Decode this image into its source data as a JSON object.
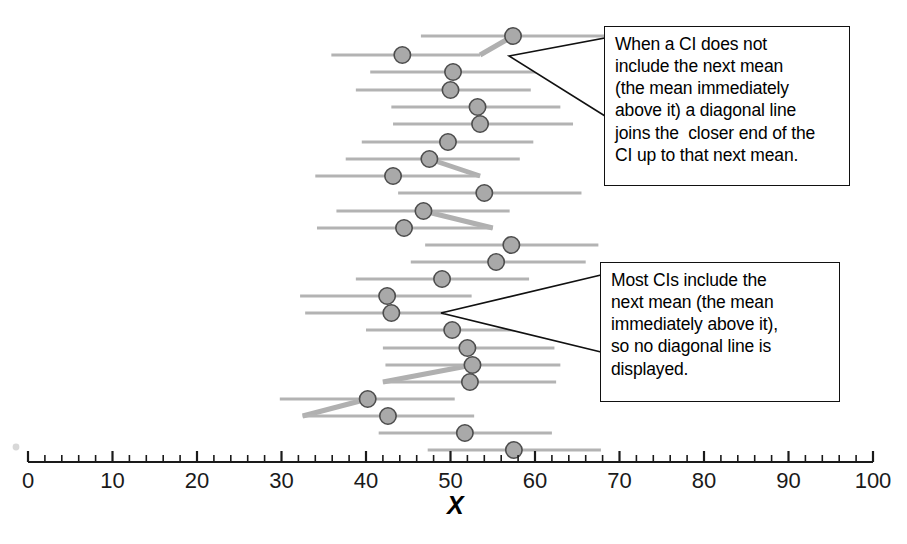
{
  "figure": {
    "axis_label": "X",
    "stray_mark": "speck"
  },
  "chart_data": {
    "type": "scatter",
    "title": "",
    "subtitle": "",
    "xlabel": "X",
    "ylabel": "",
    "xlim": [
      0,
      100
    ],
    "x_ticks": [
      0,
      10,
      20,
      30,
      40,
      50,
      60,
      70,
      80,
      90,
      100
    ],
    "x_tick_labels": [
      "0",
      "10",
      "20",
      "30",
      "40",
      "50",
      "60",
      "70",
      "80",
      "90",
      "100"
    ],
    "minor_tick_step": 2,
    "grid": false,
    "legend": "none",
    "orientation": "horizontal",
    "n_intervals": 22,
    "series": [
      {
        "name": "Confidence intervals",
        "marker": "filled-circle",
        "marker_color": "#a9a9a9",
        "marker_edge_color": "#4d4d4d",
        "line_color": "#b3b3b3",
        "points": [
          {
            "row": 1,
            "y_px": 36,
            "mean": 57.4,
            "ci_low": 46.5,
            "ci_high": 69.0,
            "diagonal_to_next": false
          },
          {
            "row": 2,
            "y_px": 55,
            "mean": 44.3,
            "ci_low": 35.9,
            "ci_high": 53.5,
            "diagonal_to_next": true,
            "diagonal_side": "right"
          },
          {
            "row": 3,
            "y_px": 72,
            "mean": 50.3,
            "ci_low": 40.5,
            "ci_high": 60.5,
            "diagonal_to_next": false
          },
          {
            "row": 4,
            "y_px": 90,
            "mean": 50.0,
            "ci_low": 38.8,
            "ci_high": 59.5,
            "diagonal_to_next": false
          },
          {
            "row": 5,
            "y_px": 107,
            "mean": 53.2,
            "ci_low": 43.0,
            "ci_high": 63.0,
            "diagonal_to_next": false
          },
          {
            "row": 6,
            "y_px": 124,
            "mean": 53.5,
            "ci_low": 43.2,
            "ci_high": 64.5,
            "diagonal_to_next": false
          },
          {
            "row": 7,
            "y_px": 142,
            "mean": 49.7,
            "ci_low": 39.5,
            "ci_high": 59.8,
            "diagonal_to_next": false
          },
          {
            "row": 8,
            "y_px": 159,
            "mean": 47.5,
            "ci_low": 37.6,
            "ci_high": 58.2,
            "diagonal_to_next": false
          },
          {
            "row": 9,
            "y_px": 176,
            "mean": 43.2,
            "ci_low": 34.0,
            "ci_high": 53.5,
            "diagonal_to_next": true,
            "diagonal_side": "right"
          },
          {
            "row": 10,
            "y_px": 193,
            "mean": 54.0,
            "ci_low": 43.8,
            "ci_high": 65.5,
            "diagonal_to_next": false
          },
          {
            "row": 11,
            "y_px": 211,
            "mean": 46.8,
            "ci_low": 36.5,
            "ci_high": 57.0,
            "diagonal_to_next": false
          },
          {
            "row": 12,
            "y_px": 228,
            "mean": 44.5,
            "ci_low": 34.2,
            "ci_high": 55.0,
            "diagonal_to_next": true,
            "diagonal_side": "right"
          },
          {
            "row": 13,
            "y_px": 245,
            "mean": 57.2,
            "ci_low": 47.0,
            "ci_high": 67.5,
            "diagonal_to_next": false
          },
          {
            "row": 14,
            "y_px": 262,
            "mean": 55.4,
            "ci_low": 45.3,
            "ci_high": 66.0,
            "diagonal_to_next": false
          },
          {
            "row": 15,
            "y_px": 279,
            "mean": 49.0,
            "ci_low": 38.8,
            "ci_high": 59.3,
            "diagonal_to_next": false
          },
          {
            "row": 16,
            "y_px": 296,
            "mean": 42.5,
            "ci_low": 32.2,
            "ci_high": 52.5,
            "diagonal_to_next": false
          },
          {
            "row": 17,
            "y_px": 313,
            "mean": 43.0,
            "ci_low": 32.8,
            "ci_high": 53.2,
            "diagonal_to_next": false
          },
          {
            "row": 18,
            "y_px": 330,
            "mean": 50.2,
            "ci_low": 40.0,
            "ci_high": 60.5,
            "diagonal_to_next": false
          },
          {
            "row": 19,
            "y_px": 348,
            "mean": 52.0,
            "ci_low": 42.0,
            "ci_high": 62.3,
            "diagonal_to_next": false
          },
          {
            "row": 20,
            "y_px": 365,
            "mean": 52.6,
            "ci_low": 42.3,
            "ci_high": 63.0,
            "diagonal_to_next": false
          },
          {
            "row": 21,
            "y_px": 382,
            "mean": 52.3,
            "ci_low": 42.0,
            "ci_high": 62.5,
            "diagonal_to_next": true,
            "diagonal_side": "left"
          },
          {
            "row": 22,
            "y_px": 399,
            "mean": 40.2,
            "ci_low": 29.8,
            "ci_high": 50.5,
            "diagonal_to_next": false
          },
          {
            "row": 23,
            "y_px": 416,
            "mean": 42.6,
            "ci_low": 32.5,
            "ci_high": 52.8,
            "diagonal_to_next": true,
            "diagonal_side": "left"
          },
          {
            "row": 24,
            "y_px": 433,
            "mean": 51.7,
            "ci_low": 41.5,
            "ci_high": 62.0,
            "diagonal_to_next": false
          },
          {
            "row": 25,
            "y_px": 450,
            "mean": 57.5,
            "ci_low": 47.3,
            "ci_high": 67.8,
            "diagonal_to_next": false
          }
        ]
      }
    ]
  },
  "callouts": [
    {
      "id": "callout-1",
      "lines": [
        "When a CI does not",
        "include the next mean",
        "(the mean immediately",
        "above it) a diagonal line",
        "joins the  closer end of the",
        "CI up to that next mean."
      ]
    },
    {
      "id": "callout-2",
      "lines": [
        "Most CIs include the",
        "next mean (the mean",
        "immediately above it),",
        "so no diagonal line is",
        "displayed."
      ]
    }
  ]
}
